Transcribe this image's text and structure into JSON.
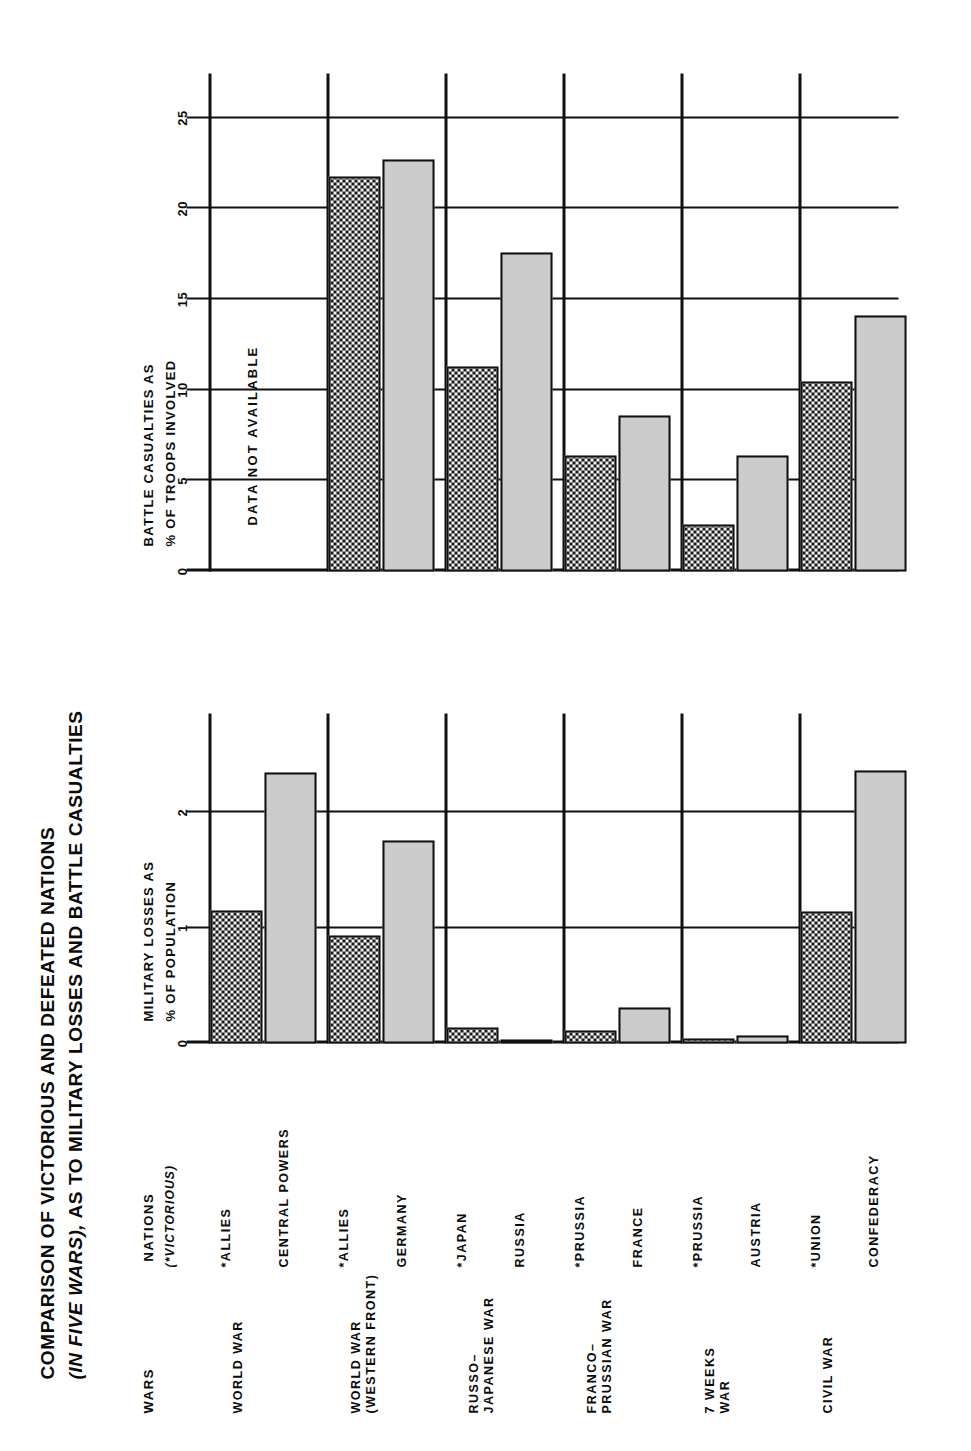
{
  "title": {
    "line1": "COMPARISON OF VICTORIOUS AND DEFEATED NATIONS",
    "line2_a": "(IN FIVE WARS),",
    "line2_b": " AS TO MILITARY LOSSES AND BATTLE CASUALTIES"
  },
  "headers": {
    "wars": "WARS",
    "nations": "NATIONS",
    "victorious_note": "(*VICTORIOUS)"
  },
  "captions": {
    "chart1_line1": "MILITARY LOSSES AS",
    "chart1_line2": "% OF POPULATION",
    "chart2_line1": "BATTLE CASUALTIES AS",
    "chart2_line2": "% OF TROOPS INVOLVED"
  },
  "notes": {
    "data_not_available": "DATA  NOT  AVAILABLE"
  },
  "rows": [
    {
      "war": "WORLD WAR",
      "victor": "*ALLIES",
      "loser": "CENTRAL POWERS"
    },
    {
      "war": "WORLD WAR\n(WESTERN FRONT)",
      "victor": "*ALLIES",
      "loser": "GERMANY"
    },
    {
      "war": "RUSSO–\nJAPANESE WAR",
      "victor": "*JAPAN",
      "loser": "RUSSIA"
    },
    {
      "war": "FRANCO–\nPRUSSIAN WAR",
      "victor": "*PRUSSIA",
      "loser": "FRANCE"
    },
    {
      "war": "7 WEEKS\nWAR",
      "victor": "*PRUSSIA",
      "loser": "AUSTRIA"
    },
    {
      "war": "CIVIL WAR",
      "victor": "*UNION",
      "loser": "CONFEDERACY"
    }
  ],
  "chart_data": [
    {
      "type": "bar",
      "title": "MILITARY LOSSES AS % OF POPULATION",
      "xlabel": "",
      "ylabel": "% OF POPULATION",
      "orientation": "horizontal-grouped",
      "categories": [
        "WORLD WAR",
        "WORLD WAR (WESTERN FRONT)",
        "RUSSO-JAPANESE WAR",
        "FRANCO-PRUSSIAN WAR",
        "7 WEEKS WAR",
        "CIVIL WAR"
      ],
      "series": [
        {
          "name": "Victorious",
          "values": [
            1.15,
            0.94,
            0.14,
            0.11,
            0.04,
            1.14
          ]
        },
        {
          "name": "Defeated",
          "values": [
            2.35,
            1.76,
            0.03,
            0.31,
            0.07,
            2.37
          ]
        }
      ],
      "xlim": [
        0,
        2.6
      ],
      "ticks": [
        "0",
        "1",
        "2"
      ],
      "tick_values": [
        0,
        1,
        2
      ],
      "grid": true,
      "legend": "none"
    },
    {
      "type": "bar",
      "title": "BATTLE CASUALTIES AS % OF TROOPS INVOLVED",
      "xlabel": "",
      "ylabel": "% OF TROOPS INVOLVED",
      "orientation": "horizontal-grouped",
      "categories": [
        "WORLD WAR",
        "WORLD WAR (WESTERN FRONT)",
        "RUSSO-JAPANESE WAR",
        "FRANCO-PRUSSIAN WAR",
        "7 WEEKS WAR",
        "CIVIL WAR"
      ],
      "series": [
        {
          "name": "Victorious",
          "values": [
            null,
            21.8,
            11.3,
            6.4,
            2.6,
            10.5
          ]
        },
        {
          "name": "Defeated",
          "values": [
            null,
            22.7,
            17.6,
            8.6,
            6.4,
            14.1
          ]
        }
      ],
      "xlim": [
        0,
        25.8
      ],
      "ticks": [
        "0",
        "5",
        "10",
        "15",
        "20",
        "25"
      ],
      "tick_values": [
        0,
        5,
        10,
        15,
        20,
        25
      ],
      "grid": true,
      "legend": "none",
      "annotation": "DATA NOT AVAILABLE"
    }
  ],
  "colors": {
    "ink": "#111111",
    "victor_fill": "#d9d9d9",
    "defeated_fill": "#cccccc",
    "paper": "#ffffff"
  }
}
